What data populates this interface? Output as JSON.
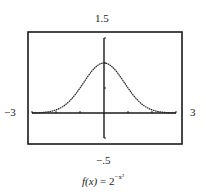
{
  "chart_data": {
    "type": "line",
    "title": "",
    "caption": "f(x) = 2^(-x^2)",
    "function": "2^(-x^2)",
    "xlabel": "",
    "ylabel": "",
    "xlim": [
      -3,
      3
    ],
    "ylim": [
      -0.5,
      1.5
    ],
    "x_tick_step": 1,
    "y_tick_step": 0.5,
    "grid": false,
    "legend": null,
    "window_labels": {
      "xmin": "−3",
      "xmax": "3",
      "ymin": "−.5",
      "ymax": "1.5"
    },
    "series": [
      {
        "name": "f(x)",
        "x": [
          -3,
          -2.5,
          -2,
          -1.5,
          -1,
          -0.5,
          0,
          0.5,
          1,
          1.5,
          2,
          2.5,
          3
        ],
        "values": [
          0.002,
          0.013,
          0.063,
          0.21,
          0.5,
          0.841,
          1.0,
          0.841,
          0.5,
          0.21,
          0.063,
          0.013,
          0.002
        ]
      }
    ]
  },
  "labels": {
    "ymax": "1.5",
    "ymin": "−.5",
    "xmin": "−3",
    "xmax": "3",
    "caption_lhs": "f(x)",
    "caption_eq": " = 2",
    "caption_exp": "−x²"
  },
  "colors": {
    "frame": "#1a1a1a",
    "axis": "#1a1a1a",
    "curve": "#222222"
  }
}
